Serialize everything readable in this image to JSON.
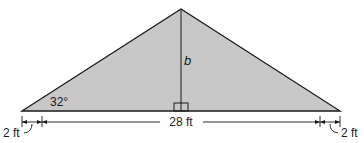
{
  "diagram": {
    "shape": "triangle",
    "fill_color": "#c8c8c8",
    "stroke_color": "#1a1a1a",
    "labels": {
      "height": "b",
      "angle": "32°",
      "base": "28 ft",
      "left_overhang": "2 ft",
      "right_overhang": "2 ft"
    },
    "right_angle_marker": true
  }
}
